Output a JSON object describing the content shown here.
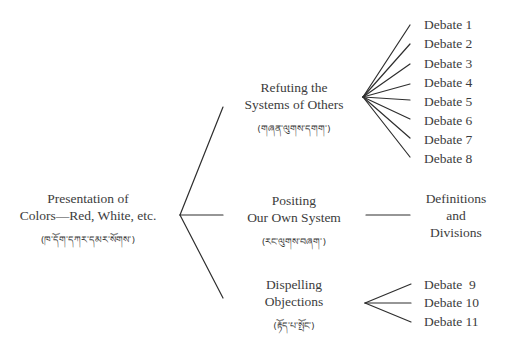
{
  "diagram": {
    "type": "tree",
    "root": {
      "label_line1": "Presentation of",
      "label_line2": "Colors—Red, White, etc.",
      "tibetan": "(ཁ་དོག་དཀར་དམར་སོགས་)"
    },
    "branches": [
      {
        "label_line1": "Refuting the",
        "label_line2": "Systems of Others",
        "tibetan": "(གཞན་ལུགས་དགག་)",
        "children": [
          "Debate 1",
          "Debate 2",
          "Debate 3",
          "Debate 4",
          "Debate 5",
          "Debate 6",
          "Debate 7",
          "Debate 8"
        ]
      },
      {
        "label_line1": "Positing",
        "label_line2": "Our Own System",
        "tibetan": "(རང་ལུགས་བཞག་)",
        "children_line1": "Definitions",
        "children_line2": "and",
        "children_line3": "Divisions"
      },
      {
        "label_line1": "Dispelling",
        "label_line2": "Objections",
        "tibetan": "(རྟོད་པ་སྤོང་)",
        "children": [
          "Debate  9",
          "Debate 10",
          "Debate 11"
        ]
      }
    ]
  }
}
